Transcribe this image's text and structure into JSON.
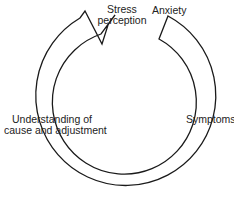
{
  "diagram": {
    "type": "cycle",
    "stroke_color": "#1a1a1a",
    "nodes": [
      {
        "id": "stress",
        "line1": "Stress",
        "line2": "perception"
      },
      {
        "id": "anxiety",
        "line1": "Anxiety"
      },
      {
        "id": "symptoms",
        "line1": "Symptoms"
      },
      {
        "id": "understanding",
        "line1": "Understanding of",
        "line2": "cause and adjustment"
      }
    ],
    "flow": "clockwise from Anxiety through Symptoms, Understanding of cause and adjustment, back to Stress perception"
  }
}
